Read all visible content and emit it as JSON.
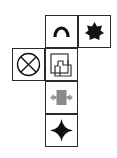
{
  "diagram": {
    "type": "cube-net",
    "cells": [
      {
        "id": "top",
        "icon": "arch-icon",
        "color": "#111111"
      },
      {
        "id": "right",
        "icon": "star-burst-icon",
        "color": "#111111"
      },
      {
        "id": "left",
        "icon": "circle-x-icon",
        "color": "#111111"
      },
      {
        "id": "center",
        "icon": "overlapping-squares-icon",
        "color": "#333333"
      },
      {
        "id": "lower",
        "icon": "gray-block-double-arrow-icon",
        "color": "#8a8a8a"
      },
      {
        "id": "bottom",
        "icon": "four-point-star-icon",
        "color": "#111111"
      }
    ]
  }
}
